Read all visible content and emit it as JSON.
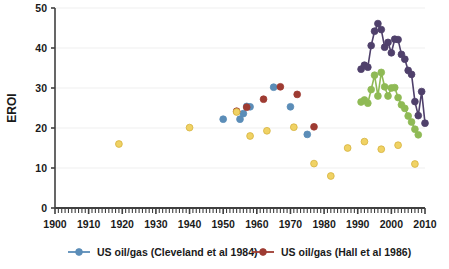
{
  "chart_data": {
    "type": "scatter",
    "title": "",
    "xlabel": "",
    "ylabel": "EROI",
    "xlim": [
      1900,
      2010
    ],
    "ylim": [
      0,
      50
    ],
    "x_ticks": [
      1900,
      1910,
      1920,
      1930,
      1940,
      1950,
      1960,
      1970,
      1980,
      1990,
      2000,
      2010
    ],
    "y_ticks": [
      0,
      10,
      20,
      30,
      40,
      50
    ],
    "x_minor_tick_step": 1,
    "grid": "horizontal-light",
    "legend_position": "bottom",
    "colors": {
      "cleveland_blue": "#5b8db8",
      "hall_red": "#9e3b32",
      "yellow": "#f0d264",
      "purple": "#4f406b",
      "green": "#8fba55",
      "axis": "#404040",
      "gridline": "#efefef"
    },
    "series": [
      {
        "name": "US oil/gas (Cleveland et al 1984)",
        "color": "#5b8db8",
        "marker": "circle",
        "line": false,
        "points": [
          [
            1950,
            22.2
          ],
          [
            1955,
            22.2
          ],
          [
            1956,
            23.6
          ],
          [
            1957,
            25.4
          ],
          [
            1958,
            25.3
          ],
          [
            1965,
            30.2
          ],
          [
            1970,
            25.3
          ],
          [
            1975,
            18.4
          ]
        ]
      },
      {
        "name": "US oil/gas (Hall et al 1986)",
        "color": "#9e3b32",
        "marker": "circle",
        "line": false,
        "points": [
          [
            1954,
            24.2
          ],
          [
            1957,
            25.2
          ],
          [
            1962,
            27.2
          ],
          [
            1967,
            30.3
          ],
          [
            1972,
            28.4
          ],
          [
            1977,
            20.3
          ]
        ]
      },
      {
        "name": "yellow-series",
        "color": "#f0d264",
        "marker": "circle",
        "line": false,
        "points": [
          [
            1919,
            16.0
          ],
          [
            1940,
            20.1
          ],
          [
            1954,
            24.0
          ],
          [
            1958,
            18.0
          ],
          [
            1963,
            19.3
          ],
          [
            1971,
            20.2
          ],
          [
            1977,
            11.1
          ],
          [
            1982,
            8.0
          ],
          [
            1987,
            15.0
          ],
          [
            1992,
            16.6
          ],
          [
            1997,
            14.7
          ],
          [
            2002,
            15.7
          ],
          [
            2007,
            11.0
          ]
        ]
      },
      {
        "name": "purple-series",
        "color": "#4f406b",
        "marker": "circle",
        "line": true,
        "points": [
          [
            1991,
            34.7
          ],
          [
            1992,
            35.7
          ],
          [
            1993,
            35.2
          ],
          [
            1994,
            40.6
          ],
          [
            1995,
            44.2
          ],
          [
            1996,
            46.1
          ],
          [
            1997,
            44.6
          ],
          [
            1998,
            40.2
          ],
          [
            1999,
            41.4
          ],
          [
            2000,
            38.8
          ],
          [
            2001,
            42.2
          ],
          [
            2002,
            42.1
          ],
          [
            2003,
            38.4
          ],
          [
            2004,
            37.2
          ],
          [
            2005,
            34.4
          ],
          [
            2006,
            33.4
          ],
          [
            2007,
            26.6
          ],
          [
            2008,
            23.1
          ],
          [
            2009,
            29.1
          ],
          [
            2010,
            21.2
          ]
        ]
      },
      {
        "name": "green-series",
        "color": "#8fba55",
        "marker": "circle",
        "line": true,
        "points": [
          [
            1991,
            26.5
          ],
          [
            1992,
            27.0
          ],
          [
            1993,
            26.2
          ],
          [
            1994,
            29.6
          ],
          [
            1995,
            33.2
          ],
          [
            1996,
            28.0
          ],
          [
            1997,
            33.9
          ],
          [
            1998,
            30.3
          ],
          [
            1999,
            28.0
          ],
          [
            2000,
            30.0
          ],
          [
            2001,
            30.1
          ],
          [
            2002,
            27.6
          ],
          [
            2003,
            25.8
          ],
          [
            2004,
            24.9
          ],
          [
            2005,
            23.0
          ],
          [
            2006,
            21.5
          ],
          [
            2007,
            19.7
          ],
          [
            2008,
            18.3
          ]
        ]
      }
    ],
    "legend": [
      {
        "label": "US oil/gas (Cleveland et al 1984)",
        "color": "#5b8db8"
      },
      {
        "label": "US oil/gas (Hall et al 1986)",
        "color": "#9e3b32"
      }
    ]
  }
}
